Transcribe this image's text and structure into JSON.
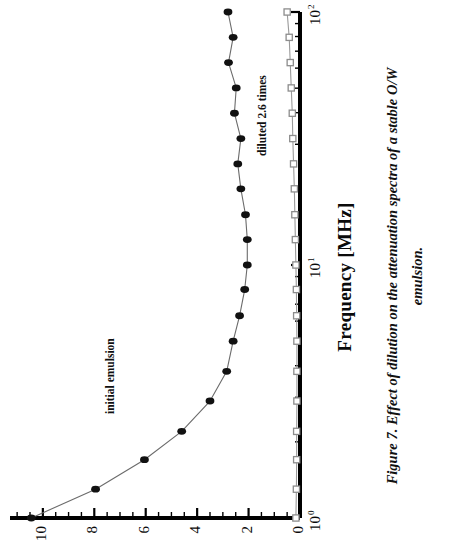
{
  "figure": {
    "caption": "Figure 7. Effect of dilution on the attenuation spectra of a stable O/W emulsion.",
    "caption_line1": "Figure 7. Effect of dilution on the attenuation spectra of a stable O/W",
    "caption_line2": "emulsion.",
    "orientation": "rotated-90-ccw",
    "background_color": "#ffffff",
    "ink_color": "#000000"
  },
  "chart_data": {
    "type": "line",
    "title": "",
    "xlabel": "Frequency [MHz]",
    "ylabel": "",
    "xscale": "log",
    "yscale": "linear",
    "xlim": [
      1,
      100
    ],
    "ylim": [
      0,
      11.2
    ],
    "grid": false,
    "legend_position": "in-plot-annotations",
    "xtick_labels": [
      "10 0",
      "10 1",
      "10 2"
    ],
    "xticks": [
      1,
      10,
      100
    ],
    "xtick_mantissa": "10",
    "xtick_exponents": [
      "0",
      "1",
      "2"
    ],
    "yticks": [
      0,
      2,
      4,
      6,
      8,
      10
    ],
    "ytick_labels": [
      "0",
      "2",
      "4",
      "6",
      "8",
      "10"
    ],
    "yminor_step": 0.5,
    "series": [
      {
        "name": "initial emulsion",
        "marker": "filled-circle",
        "marker_color": "#111111",
        "line_color": "#6b6b6b",
        "x": [
          1.0,
          1.3,
          1.7,
          2.2,
          2.9,
          3.8,
          5.0,
          6.3,
          8.0,
          10.0,
          12.6,
          15.8,
          20.0,
          25.1,
          31.6,
          39.8,
          50.1,
          63.1,
          79.4,
          100.0
        ],
        "y": [
          10.45,
          7.95,
          6.05,
          4.6,
          3.5,
          2.85,
          2.6,
          2.35,
          2.15,
          2.05,
          2.05,
          2.12,
          2.3,
          2.42,
          2.3,
          2.55,
          2.48,
          2.78,
          2.6,
          2.8
        ]
      },
      {
        "name": "diluted 2.6 times",
        "marker": "open-square",
        "marker_color": "#8c8c8c",
        "line_color": "#9a9a9a",
        "x": [
          1.0,
          1.3,
          1.7,
          2.2,
          2.9,
          3.8,
          5.0,
          6.3,
          8.0,
          10.0,
          12.6,
          15.8,
          20.0,
          25.1,
          31.6,
          39.8,
          50.1,
          63.1,
          79.4,
          100.0
        ],
        "y": [
          0.16,
          0.14,
          0.13,
          0.13,
          0.12,
          0.12,
          0.12,
          0.13,
          0.14,
          0.16,
          0.18,
          0.2,
          0.22,
          0.25,
          0.28,
          0.3,
          0.34,
          0.38,
          0.42,
          0.5
        ]
      }
    ],
    "annotations": [
      {
        "text": "initial emulsion",
        "series": "initial emulsion"
      },
      {
        "text": "diluted 2.6 times",
        "series": "diluted 2.6 times"
      }
    ]
  }
}
